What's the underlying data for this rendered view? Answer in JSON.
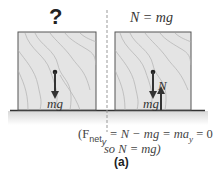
{
  "left_panel": {
    "label": "?",
    "force_label": "mg"
  },
  "right_panel": {
    "label": "N = mg",
    "force_labels": {
      "normal": "N",
      "weight": "mg"
    }
  },
  "equation": {
    "line1_prefix": "(F",
    "line1_sub": "net",
    "line1_subsub": "y",
    "line1_rest": " = N − mg = ma",
    "line1_sub2": "y",
    "line1_end": " = 0",
    "line2": "so N = mg)"
  },
  "panel_label": "(a)",
  "colors": {
    "box_fill": "#e4e4e4",
    "box_border": "#444444",
    "arrow_dark": "#333333",
    "grain": "#b0b0b0",
    "divider": "#999999"
  }
}
